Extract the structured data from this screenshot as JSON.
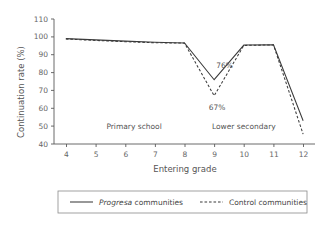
{
  "chart_data": {
    "type": "line",
    "title": "",
    "xlabel": "Entering grade",
    "ylabel": "Continuation rate (%)",
    "x": [
      4,
      5,
      6,
      7,
      8,
      9,
      10,
      11,
      12
    ],
    "xlim": [
      3.6,
      12.4
    ],
    "ylim": [
      40,
      110
    ],
    "yticks": [
      40,
      50,
      60,
      70,
      80,
      90,
      100,
      110
    ],
    "xticks": [
      4,
      5,
      6,
      7,
      8,
      9,
      10,
      11,
      12
    ],
    "xticklabels": [
      "4",
      "5",
      "6",
      "7",
      "8",
      "9",
      "10",
      "11",
      "12"
    ],
    "yticklabels": [
      "40",
      "50",
      "60",
      "70",
      "80",
      "90",
      "100",
      "110"
    ],
    "grid": false,
    "legend_position": "below-outside",
    "series": [
      {
        "name": "Progresa communities",
        "name_italic_prefix": "Progresa",
        "name_roman_suffix": " communities",
        "style": "solid",
        "color": "#3a3a3a",
        "values": [
          99.0,
          98.3,
          97.6,
          97.0,
          96.6,
          76.0,
          95.4,
          95.5,
          53.0
        ]
      },
      {
        "name": "Control communities",
        "name_italic_prefix": "",
        "name_roman_suffix": "Control communities",
        "style": "dashed",
        "color": "#3a3a3a",
        "values": [
          98.8,
          98.0,
          97.3,
          96.7,
          96.5,
          67.0,
          95.2,
          95.5,
          45.5
        ]
      }
    ],
    "annotations": [
      {
        "id": "progresa-dip",
        "text": "76%",
        "x": 9.35,
        "y": 84.0
      },
      {
        "id": "control-dip",
        "text": "67%",
        "x": 9.1,
        "y": 60.5
      }
    ],
    "region_labels": [
      {
        "id": "primary-school",
        "text": "Primary school",
        "x": 6.3,
        "y": 50.0
      },
      {
        "id": "lower-secondary",
        "text": "Lower secondary",
        "x": 10.0,
        "y": 50.0
      }
    ]
  },
  "legend": {
    "items": [
      {
        "label_italic": "Progresa",
        "label_rest": " communities",
        "style": "solid"
      },
      {
        "label_italic": "",
        "label_rest": "Control communities",
        "style": "dashed"
      }
    ]
  }
}
